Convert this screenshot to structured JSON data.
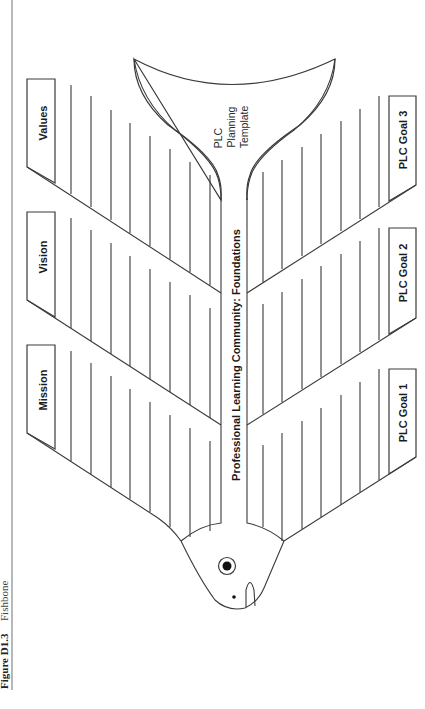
{
  "caption": {
    "figure_label": "Figure D1.3",
    "figure_title": "Fishbone"
  },
  "diagram": {
    "spine_label": "Professional Learning Community: Foundations",
    "tail_label": [
      "PLC",
      "Planning",
      "Template"
    ],
    "left_categories": [
      {
        "label": "Values"
      },
      {
        "label": "Vision"
      },
      {
        "label": "Mission"
      }
    ],
    "right_categories": [
      {
        "label": "PLC Goal 3"
      },
      {
        "label": "PLC Goal 2"
      },
      {
        "label": "PLC Goal 1"
      }
    ],
    "lines_per_branch": 8,
    "colors": {
      "stroke": "#3a3a3a",
      "background": "#ffffff",
      "text": "#1a1a1a"
    }
  }
}
